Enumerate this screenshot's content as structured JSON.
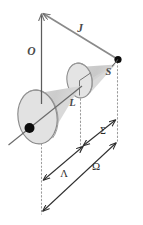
{
  "figure": {
    "background_color": "#ffffff",
    "width": 143,
    "height": 225,
    "labels": {
      "axis_label": "O",
      "total_momentum_label": "J",
      "spin_cone_label": "S",
      "orbital_cone_label": "L",
      "sigma_label": "Σ",
      "lambda_label": "Λ",
      "omega_label": "Ω"
    },
    "colors": {
      "cone_fill": "#cfcfcf",
      "ellipse_fill": "#e3e3e3",
      "outline": "#8a8a8a",
      "axis_line": "#5a5a5a",
      "arrow_line": "#7a7a7a",
      "dotted_line": "#9a9a9a",
      "dim_line": "#3a3a3a",
      "label_gray": "#4a4a4a",
      "label_dark": "#2b2b2b",
      "dot_fill": "#000000"
    },
    "elements": [
      {
        "name": "vertical-axis-arrow",
        "label": "O"
      },
      {
        "name": "total-angular-momentum-arrow",
        "label": "J"
      },
      {
        "name": "spin-cone",
        "label": "S"
      },
      {
        "name": "orbital-cone",
        "label": "L"
      },
      {
        "name": "sigma-projection",
        "label": "Σ"
      },
      {
        "name": "lambda-projection",
        "label": "Λ"
      },
      {
        "name": "omega-projection",
        "label": "Ω"
      }
    ]
  }
}
